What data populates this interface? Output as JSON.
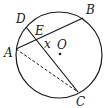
{
  "diagram": {
    "type": "circle-geometry",
    "circle": {
      "cx": 59,
      "cy": 55,
      "r": 43,
      "center_label": "O"
    },
    "points": {
      "A": {
        "x": 16,
        "y": 49,
        "label": "A"
      },
      "B": {
        "x": 83,
        "y": 18,
        "label": "B"
      },
      "C": {
        "x": 78,
        "y": 92,
        "label": "C"
      },
      "D": {
        "x": 26,
        "y": 27,
        "label": "D"
      },
      "E": {
        "x": 38,
        "y": 40,
        "label": "E"
      },
      "O": {
        "x": 60,
        "y": 54,
        "label": "O"
      }
    },
    "angle_label": "x",
    "segments": [
      {
        "from": "A",
        "to": "B",
        "style": "solid"
      },
      {
        "from": "D",
        "to": "C",
        "style": "solid"
      },
      {
        "from": "A",
        "to": "C",
        "style": "dashed"
      }
    ],
    "stroke_color": "#1a1a1a"
  }
}
